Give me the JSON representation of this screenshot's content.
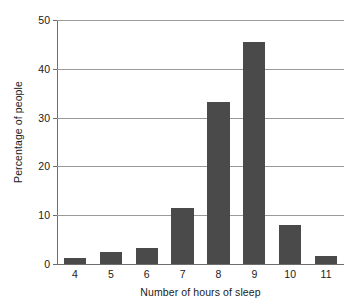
{
  "chart_data": {
    "type": "bar",
    "title": "",
    "xlabel": "Number of hours of sleep",
    "ylabel": "Percentage of people",
    "categories": [
      "4",
      "5",
      "6",
      "7",
      "8",
      "9",
      "10",
      "11"
    ],
    "values": [
      1.2,
      2.4,
      3.2,
      11.4,
      33.3,
      45.4,
      8.0,
      1.6
    ],
    "series": [
      {
        "name": "Percentage of people",
        "values": [
          1.2,
          2.4,
          3.2,
          11.4,
          33.3,
          45.4,
          8.0,
          1.6
        ]
      }
    ],
    "ylim": [
      0,
      50
    ],
    "yticks": [
      0,
      10,
      20,
      30,
      40,
      50
    ],
    "ytick_labels": [
      "0",
      "10",
      "20",
      "30",
      "40",
      "50"
    ],
    "xtick_labels": [
      "4",
      "5",
      "6",
      "7",
      "8",
      "9",
      "10",
      "11"
    ],
    "grid": true,
    "grid_axis": "y",
    "legend": false,
    "legend_position": "none",
    "bar_color": "#4a4a4a",
    "grid_color": "#9a9a9a",
    "axis_color": "#6e6e6e",
    "background_color": "#ffffff",
    "text_color": "#1a1a1a"
  }
}
